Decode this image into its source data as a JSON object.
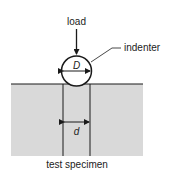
{
  "diagram": {
    "labels": {
      "load": "load",
      "indenter": "indenter",
      "ball_diameter": "D",
      "indent_diameter": "d",
      "specimen": "test specimen"
    },
    "colors": {
      "specimen_fill": "#d9d9d9",
      "line": "#1a1a1a",
      "background": "#ffffff"
    }
  }
}
